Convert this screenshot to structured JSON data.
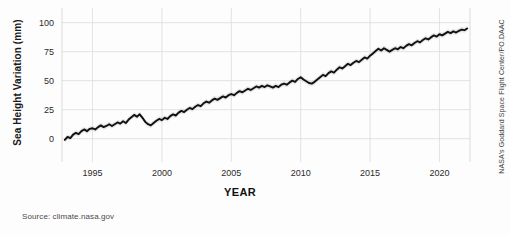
{
  "figure": {
    "source_note": "Source: climate.nasa.gov",
    "credit": "NASA's Goddard Space Flight Center/PO.DAAC",
    "background_color": "#fdfdfd",
    "line_color": "#111111",
    "band_color": "#cfcfcf",
    "grid_color": "#dcdcdc"
  },
  "chart_data": {
    "type": "line",
    "title": "",
    "xlabel": "YEAR",
    "ylabel": "Sea Height Variation (mm)",
    "xlim": [
      1992.8,
      2022.2
    ],
    "ylim": [
      -8,
      104
    ],
    "xticks": [
      1995,
      2000,
      2005,
      2010,
      2015,
      2020
    ],
    "xticklabels": [
      "1995",
      "2000",
      "2005",
      "2010",
      "2015",
      "2020"
    ],
    "yticks": [
      0,
      25,
      50,
      75,
      100
    ],
    "yticklabels": [
      "0",
      "25",
      "50",
      "75",
      "100"
    ],
    "grid": true,
    "legend": "none",
    "uncertainty_band": true,
    "uncertainty_mm": 2.2,
    "series": [
      {
        "name": "Sea Height Variation",
        "units": "mm",
        "x": [
          1993.0,
          1993.2,
          1993.4,
          1993.6,
          1993.8,
          1994.0,
          1994.2,
          1994.4,
          1994.6,
          1994.8,
          1995.0,
          1995.2,
          1995.4,
          1995.6,
          1995.8,
          1996.0,
          1996.2,
          1996.4,
          1996.6,
          1996.8,
          1997.0,
          1997.2,
          1997.4,
          1997.6,
          1997.8,
          1998.0,
          1998.2,
          1998.4,
          1998.6,
          1998.8,
          1999.0,
          1999.2,
          1999.4,
          1999.6,
          1999.8,
          2000.0,
          2000.2,
          2000.4,
          2000.6,
          2000.8,
          2001.0,
          2001.2,
          2001.4,
          2001.6,
          2001.8,
          2002.0,
          2002.2,
          2002.4,
          2002.6,
          2002.8,
          2003.0,
          2003.2,
          2003.4,
          2003.6,
          2003.8,
          2004.0,
          2004.2,
          2004.4,
          2004.6,
          2004.8,
          2005.0,
          2005.2,
          2005.4,
          2005.6,
          2005.8,
          2006.0,
          2006.2,
          2006.4,
          2006.6,
          2006.8,
          2007.0,
          2007.2,
          2007.4,
          2007.6,
          2007.8,
          2008.0,
          2008.2,
          2008.4,
          2008.6,
          2008.8,
          2009.0,
          2009.2,
          2009.4,
          2009.6,
          2009.8,
          2010.0,
          2010.2,
          2010.4,
          2010.6,
          2010.8,
          2011.0,
          2011.2,
          2011.4,
          2011.6,
          2011.8,
          2012.0,
          2012.2,
          2012.4,
          2012.6,
          2012.8,
          2013.0,
          2013.2,
          2013.4,
          2013.6,
          2013.8,
          2014.0,
          2014.2,
          2014.4,
          2014.6,
          2014.8,
          2015.0,
          2015.2,
          2015.4,
          2015.6,
          2015.8,
          2016.0,
          2016.2,
          2016.4,
          2016.6,
          2016.8,
          2017.0,
          2017.2,
          2017.4,
          2017.6,
          2017.8,
          2018.0,
          2018.2,
          2018.4,
          2018.6,
          2018.8,
          2019.0,
          2019.2,
          2019.4,
          2019.6,
          2019.8,
          2020.0,
          2020.2,
          2020.4,
          2020.6,
          2020.8,
          2021.0,
          2021.2,
          2021.4,
          2021.6,
          2021.8,
          2022.0
        ],
        "y": [
          -1.0,
          1.5,
          0.5,
          3.5,
          5.0,
          4.0,
          6.5,
          8.0,
          6.5,
          8.5,
          9.0,
          8.0,
          10.0,
          11.5,
          10.0,
          11.0,
          12.5,
          11.0,
          12.5,
          14.0,
          13.0,
          15.0,
          13.5,
          16.5,
          18.5,
          20.5,
          19.0,
          21.0,
          18.0,
          14.5,
          12.5,
          11.5,
          13.5,
          15.5,
          17.0,
          16.0,
          18.0,
          17.0,
          19.5,
          21.0,
          20.0,
          22.5,
          24.0,
          23.0,
          25.0,
          26.5,
          25.5,
          27.5,
          29.0,
          28.0,
          30.5,
          32.0,
          31.0,
          33.0,
          34.5,
          33.5,
          35.0,
          36.5,
          35.5,
          37.5,
          38.5,
          37.5,
          39.5,
          41.0,
          40.0,
          41.5,
          43.0,
          42.0,
          43.5,
          45.0,
          44.0,
          45.5,
          44.5,
          46.0,
          45.0,
          44.0,
          45.5,
          44.5,
          46.5,
          47.5,
          46.5,
          48.5,
          50.0,
          49.0,
          51.5,
          53.0,
          51.0,
          49.5,
          48.0,
          47.5,
          49.0,
          51.0,
          53.0,
          55.0,
          54.0,
          56.5,
          58.0,
          57.0,
          59.5,
          61.5,
          60.5,
          62.5,
          64.5,
          63.5,
          65.5,
          67.0,
          66.0,
          68.0,
          70.0,
          69.0,
          71.5,
          73.5,
          75.5,
          77.5,
          76.0,
          78.0,
          76.5,
          75.0,
          76.5,
          78.0,
          77.0,
          79.0,
          78.0,
          80.0,
          81.5,
          80.5,
          82.5,
          84.0,
          83.0,
          85.0,
          86.5,
          85.5,
          87.5,
          89.0,
          88.0,
          90.0,
          89.0,
          90.5,
          92.0,
          91.0,
          92.5,
          91.5,
          93.0,
          94.0,
          93.5,
          95.0
        ]
      }
    ]
  }
}
